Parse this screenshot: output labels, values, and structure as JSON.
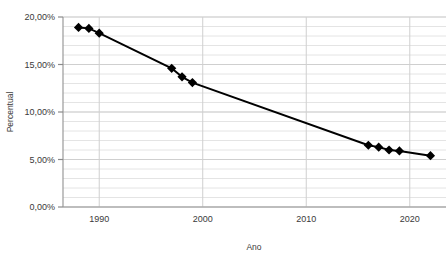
{
  "chart_data": {
    "type": "line",
    "title": "",
    "xlabel": "Ano",
    "ylabel": "Percentual",
    "xlim": [
      1986.5,
      2023.5
    ],
    "ylim": [
      0,
      20
    ],
    "xticks": [
      1990,
      2000,
      2010,
      2020
    ],
    "xticklabels": [
      "1990",
      "2000",
      "2010",
      "2020"
    ],
    "yticks": [
      0,
      5,
      10,
      15,
      20
    ],
    "yticklabels": [
      "0,00%",
      "5,00%",
      "10,00%",
      "15,00%",
      "20,00%"
    ],
    "grid": true,
    "grid_minor_step": 1,
    "legend": "none",
    "marker": "diamond",
    "line_color": "#000000",
    "marker_color": "#000000",
    "grid_color": "#d9d9d9",
    "axis_color": "#808080",
    "x": [
      1988,
      1989,
      1990,
      1997,
      1998,
      1999,
      2016,
      2017,
      2018,
      2019,
      2022
    ],
    "values": [
      18.9,
      18.8,
      18.3,
      14.6,
      13.7,
      13.1,
      6.5,
      6.3,
      6.0,
      5.9,
      5.4
    ],
    "points": [
      {
        "x": 1988,
        "y": 18.9
      },
      {
        "x": 1989,
        "y": 18.8
      },
      {
        "x": 1990,
        "y": 18.3
      },
      {
        "x": 1997,
        "y": 14.6
      },
      {
        "x": 1998,
        "y": 13.7
      },
      {
        "x": 1999,
        "y": 13.1
      },
      {
        "x": 2016,
        "y": 6.5
      },
      {
        "x": 2017,
        "y": 6.3
      },
      {
        "x": 2018,
        "y": 6.0
      },
      {
        "x": 2019,
        "y": 5.9
      },
      {
        "x": 2022,
        "y": 5.4
      }
    ]
  }
}
